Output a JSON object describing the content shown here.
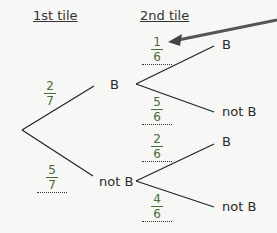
{
  "headers": {
    "first": "1st tile",
    "second": "2nd tile"
  },
  "nodes": {
    "b": "B",
    "notb": "not B",
    "bb": "B",
    "bnotb": "not B",
    "notbb": "B",
    "notbnotb": "not B"
  },
  "probabilities": {
    "p_b": {
      "num": "2",
      "den": "7"
    },
    "p_notb": {
      "num": "5",
      "den": "7"
    },
    "p_b_b": {
      "num": "1",
      "den": "6"
    },
    "p_b_notb": {
      "num": "5",
      "den": "6"
    },
    "p_notb_b": {
      "num": "2",
      "den": "6"
    },
    "p_notb_notb": {
      "num": "4",
      "den": "6"
    }
  }
}
